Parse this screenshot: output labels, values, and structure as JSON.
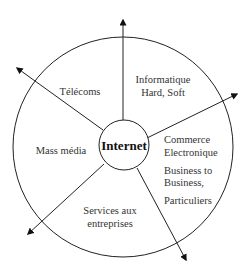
{
  "diagram": {
    "center": {
      "label": "Internet"
    },
    "sectors": [
      {
        "id": "telecoms",
        "lines": [
          "Télécoms"
        ]
      },
      {
        "id": "informatique",
        "lines": [
          "Informatique",
          "Hard, Soft"
        ]
      },
      {
        "id": "commerce",
        "lines": [
          "Commerce",
          "Electronique",
          "Business to",
          "Business,",
          "Particuliers"
        ]
      },
      {
        "id": "services",
        "lines": [
          "Services aux",
          "entreprises"
        ]
      },
      {
        "id": "mass-media",
        "lines": [
          "Mass média"
        ]
      }
    ],
    "arrows": 5,
    "colors": {
      "stroke": "#222222",
      "text": "#333333",
      "background": "#ffffff"
    }
  }
}
